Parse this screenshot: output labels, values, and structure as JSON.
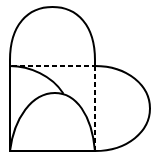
{
  "figure": {
    "stroke_color": "#000000",
    "background": "#ffffff",
    "square": {
      "x": 10,
      "y": 66,
      "size": 85
    },
    "top_semicircle": {
      "cx": 52.5,
      "cy": 66,
      "rx": 42.5,
      "ry": 59
    },
    "right_half_ellipse": {
      "cx": 95,
      "cy": 108.5,
      "rx": 55,
      "ry": 42.5
    },
    "inner_arc_lower": {
      "from": [
        10,
        151
      ],
      "peak": [
        55,
        93
      ],
      "to": [
        95,
        151
      ]
    },
    "inner_arc_upper": {
      "from": [
        10,
        66
      ],
      "to": [
        63,
        93
      ]
    },
    "dashed_lines": [
      {
        "from": [
          10,
          66
        ],
        "to": [
          95,
          66
        ]
      },
      {
        "from": [
          95,
          66
        ],
        "to": [
          95,
          151
        ]
      }
    ]
  }
}
